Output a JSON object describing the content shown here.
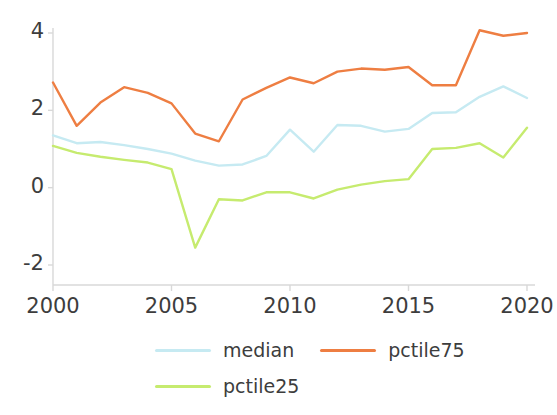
{
  "chart_data": {
    "type": "line",
    "title": "",
    "xlabel": "",
    "ylabel": "",
    "x": [
      2000,
      2001,
      2002,
      2003,
      2004,
      2005,
      2006,
      2007,
      2008,
      2009,
      2010,
      2011,
      2012,
      2013,
      2014,
      2015,
      2016,
      2017,
      2018,
      2019,
      2020
    ],
    "xlim": [
      2000,
      2020
    ],
    "ylim": [
      -2.4,
      4.3
    ],
    "xticks": [
      2000,
      2005,
      2010,
      2015,
      2020
    ],
    "xtick_labels": [
      "2000",
      "2005",
      "2010",
      "2015",
      "2020"
    ],
    "yticks": [
      4,
      2,
      0,
      -2
    ],
    "ytick_labels": [
      "4",
      "2",
      "0",
      "-2"
    ],
    "grid": false,
    "legend_position": "below",
    "series": [
      {
        "name": "median",
        "color": "#c6eaf2",
        "values": [
          1.35,
          1.15,
          1.18,
          1.1,
          1.0,
          0.88,
          0.7,
          0.57,
          0.6,
          0.82,
          1.5,
          0.93,
          1.62,
          1.6,
          1.45,
          1.52,
          1.93,
          1.95,
          2.35,
          2.62,
          2.32
        ]
      },
      {
        "name": "pctile75",
        "color": "#ee7e42",
        "values": [
          2.72,
          1.6,
          2.2,
          2.6,
          2.45,
          2.18,
          1.4,
          1.2,
          2.28,
          2.58,
          2.85,
          2.7,
          3.0,
          3.08,
          3.05,
          3.12,
          2.65,
          2.65,
          4.07,
          3.93,
          4.0
        ]
      },
      {
        "name": "pctile25",
        "color": "#c6eb6f",
        "values": [
          1.08,
          0.9,
          0.8,
          0.72,
          0.65,
          0.48,
          -1.55,
          -0.3,
          -0.33,
          -0.12,
          -0.12,
          -0.28,
          -0.05,
          0.08,
          0.17,
          0.22,
          1.0,
          1.03,
          1.15,
          0.78,
          1.55
        ]
      }
    ]
  },
  "axes": {
    "y_tick_labels": [
      "4",
      "2",
      "0",
      "-2"
    ],
    "x_tick_labels": [
      "2000",
      "2005",
      "2010",
      "2015",
      "2020"
    ]
  },
  "legend": {
    "items": [
      {
        "label": "median",
        "color": "#c6eaf2"
      },
      {
        "label": "pctile75",
        "color": "#ee7e42"
      },
      {
        "label": "pctile25",
        "color": "#c6eb6f"
      }
    ]
  }
}
